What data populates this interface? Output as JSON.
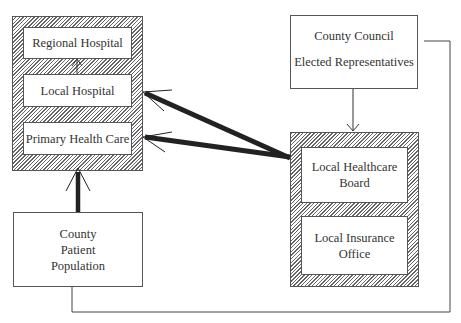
{
  "diagram": {
    "left_group": {
      "regional_hospital": "Regional Hospital",
      "local_hospital": "Local Hospital",
      "primary_health_care": "Primary Health Care"
    },
    "county_patient_population": [
      "County",
      "Patient",
      "Population"
    ],
    "county_council": [
      "County Council",
      "Elected Representatives"
    ],
    "right_group": {
      "local_healthcare_board": [
        "Local Healthcare",
        "Board"
      ],
      "local_insurance_office": [
        "Local Insurance",
        "Office"
      ]
    },
    "colors": {
      "line": "#333333",
      "hatch": "#666666",
      "border": "#555555"
    }
  }
}
